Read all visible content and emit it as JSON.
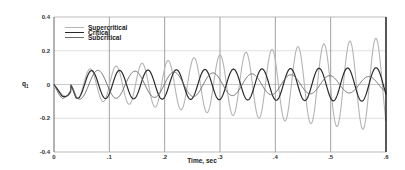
{
  "chart_data": {
    "type": "line",
    "title": "",
    "xlabel": "Time, sec",
    "ylabel": "q1",
    "xlim": [
      0,
      0.6
    ],
    "ylim": [
      -0.4,
      0.4
    ],
    "grid": true,
    "legend_position": "upper-left",
    "x_ticks": [
      "0",
      ".1",
      ".2",
      ".3",
      ".4",
      ".5",
      ".6"
    ],
    "y_ticks": [
      "0.4",
      "0.2",
      "0",
      "-0.2",
      "-0.4"
    ],
    "x_tick_values": [
      0,
      0.1,
      0.2,
      0.3,
      0.4,
      0.5,
      0.6
    ],
    "y_tick_values": [
      0.4,
      0.2,
      0,
      -0.2,
      -0.4
    ],
    "series": [
      {
        "name": "Supercritical",
        "color": "#b4b4b4",
        "width": 1.1,
        "freq_hz": 21.3,
        "amp_start": 0.07,
        "amp_end": 0.28,
        "phase": 0.0,
        "sample_x": [
          0,
          0.05,
          0.1,
          0.15,
          0.2,
          0.25,
          0.3,
          0.35,
          0.4,
          0.45,
          0.5,
          0.55,
          0.6
        ],
        "sample_peaks_approx": [
          0,
          0.09,
          0.12,
          0.14,
          0.16,
          0.18,
          0.2,
          0.22,
          0.23,
          0.24,
          0.26,
          0.27,
          0.28
        ]
      },
      {
        "name": "Critical",
        "color": "#2a2a2a",
        "width": 1.2,
        "freq_hz": 19.4,
        "amp_start": 0.08,
        "amp_end": 0.1,
        "phase": 0.25,
        "sample_x": [
          0,
          0.05,
          0.1,
          0.15,
          0.2,
          0.25,
          0.3,
          0.35,
          0.4,
          0.45,
          0.5,
          0.55,
          0.6
        ],
        "sample_peaks_approx": [
          0,
          0.09,
          0.1,
          0.1,
          0.1,
          0.1,
          0.1,
          0.1,
          0.1,
          0.1,
          0.1,
          0.1,
          0.1
        ]
      },
      {
        "name": "Subcritical",
        "color": "#6a6a6a",
        "width": 1.0,
        "freq_hz": 14.2,
        "amp_start": 0.09,
        "amp_end": 0.045,
        "phase": 0.6,
        "sample_x": [
          0,
          0.05,
          0.1,
          0.15,
          0.2,
          0.25,
          0.3,
          0.35,
          0.4,
          0.45,
          0.5,
          0.55,
          0.6
        ],
        "sample_peaks_approx": [
          0,
          0.08,
          0.075,
          0.07,
          0.065,
          0.06,
          0.058,
          0.055,
          0.052,
          0.05,
          0.048,
          0.046,
          0.045
        ]
      }
    ],
    "initial_dip": {
      "t": 0.015,
      "value": -0.07
    }
  },
  "legend": {
    "items": [
      {
        "label": "Supercritical"
      },
      {
        "label": "Critical"
      },
      {
        "label": "Subcritical"
      }
    ]
  },
  "axes": {
    "xlabel": "Time, sec",
    "ylabel_main": "q",
    "ylabel_sub": "1"
  }
}
